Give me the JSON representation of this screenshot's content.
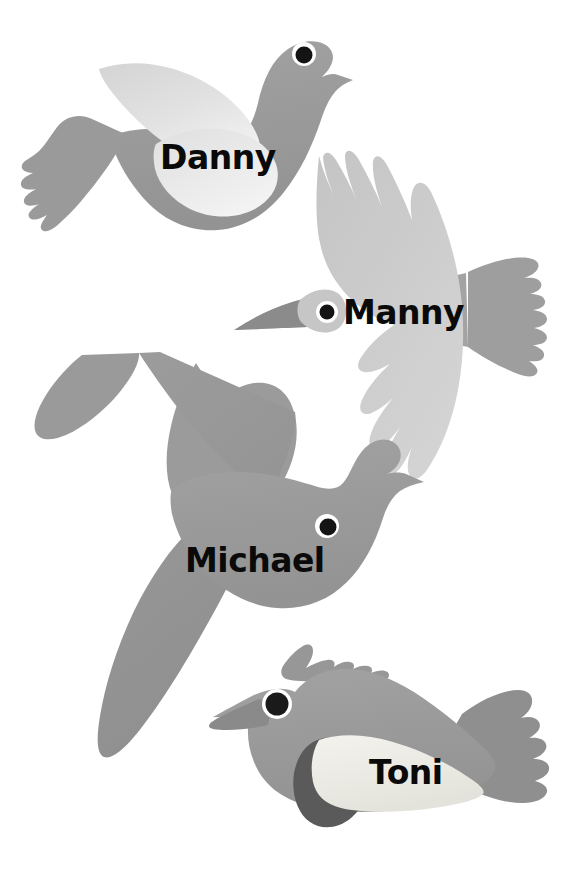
{
  "page": {
    "background_color": "#ffffff",
    "width": 582,
    "height": 877
  },
  "palette": {
    "body_gray": "#9a9a9a",
    "body_gray_dark": "#8d8d8d",
    "wing_light": "#cfcfcf",
    "wing_lighter": "#e4e4e4",
    "wing_pale": "#efefef",
    "belly_cream": "#eceae2",
    "patch_dark": "#5a5a5a",
    "beak_dark": "#808080",
    "eye_black": "#111111",
    "eye_white": "#ffffff",
    "label_color": "#0a0a0a"
  },
  "birds": [
    {
      "id": "danny",
      "name": "Danny",
      "pose": "gliding-left-facing-right",
      "label_position": {
        "x": 160,
        "y": 141
      },
      "label_font_size": 33,
      "features": [
        "tail",
        "body",
        "folded-wing",
        "eye",
        "beak"
      ]
    },
    {
      "id": "manny",
      "name": "Manny",
      "pose": "head-on-wings-spread",
      "label_position": {
        "x": 343,
        "y": 296
      },
      "label_font_size": 33,
      "features": [
        "left-wing",
        "right-wing",
        "tail",
        "head",
        "eye",
        "beak"
      ]
    },
    {
      "id": "michael",
      "name": "Michael",
      "pose": "flying-wings-up-and-down",
      "label_position": {
        "x": 185,
        "y": 544
      },
      "label_font_size": 33,
      "features": [
        "upper-wing",
        "lower-wing",
        "tail",
        "body",
        "eye",
        "beak"
      ]
    },
    {
      "id": "toni",
      "name": "Toni",
      "pose": "perched-crested-facing-left",
      "label_position": {
        "x": 369,
        "y": 756
      },
      "label_font_size": 33,
      "features": [
        "crest",
        "body",
        "dark-patch",
        "cream-belly",
        "tail",
        "eye",
        "beak"
      ]
    }
  ]
}
